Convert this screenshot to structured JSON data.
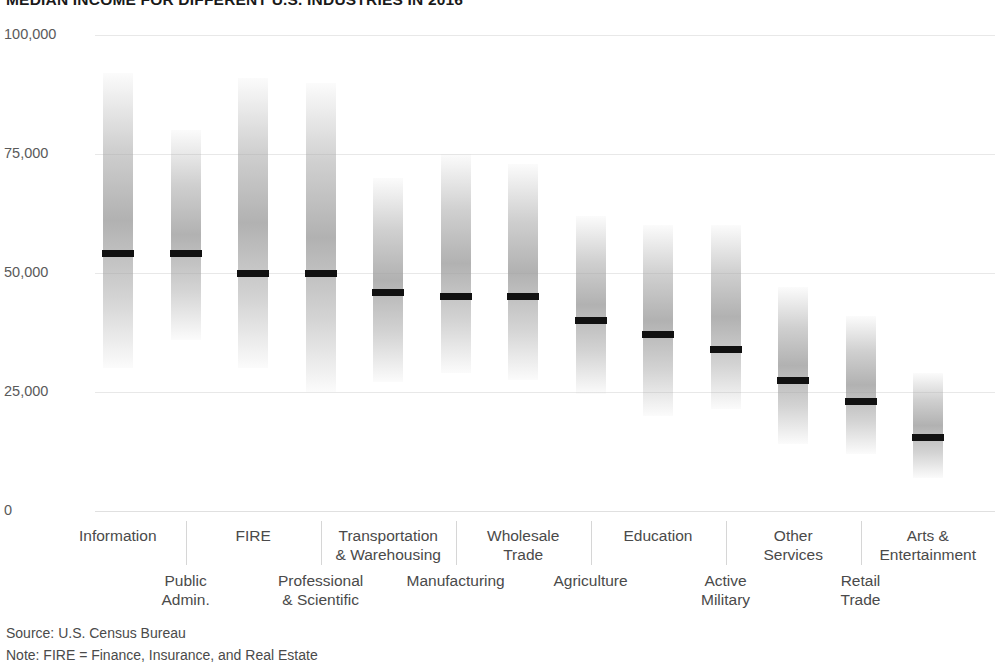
{
  "chart_data": {
    "type": "bar",
    "title": "MEDIAN INCOME FOR DIFFERENT U.S. INDUSTRIES IN 2016",
    "xlabel": "",
    "ylabel": "",
    "ylim": [
      0,
      100000
    ],
    "ytick_labels": [
      "100,000",
      "75,000",
      "50,000",
      "25,000",
      "0"
    ],
    "ytick_values": [
      100000,
      75000,
      50000,
      25000,
      0
    ],
    "grid": true,
    "legend": "none",
    "value_unit": "US dollars",
    "note": "Each bar spans the income range (low to high) with a black line marking the median.",
    "categories": [
      "Information",
      "Public Admin.",
      "FIRE",
      "Professional & Scientific",
      "Transportation & Warehousing",
      "Manufacturing",
      "Wholesale Trade",
      "Agriculture",
      "Education",
      "Active Military",
      "Other Services",
      "Retail Trade",
      "Arts & Entertainment"
    ],
    "series": [
      {
        "name": "range_high",
        "values": [
          92000,
          80000,
          91000,
          90000,
          70000,
          75000,
          73000,
          62000,
          60000,
          60000,
          47000,
          41000,
          29000
        ]
      },
      {
        "name": "median",
        "values": [
          54000,
          54000,
          50000,
          50000,
          46000,
          45000,
          45000,
          40000,
          37000,
          34000,
          27500,
          23000,
          15500
        ]
      },
      {
        "name": "range_low",
        "values": [
          30000,
          36000,
          30000,
          25000,
          27000,
          29000,
          27500,
          24500,
          20000,
          21500,
          14000,
          12000,
          7000
        ]
      }
    ]
  },
  "yaxis": {
    "ticks": [
      {
        "label": "100,000",
        "value": 100000
      },
      {
        "label": "75,000",
        "value": 75000
      },
      {
        "label": "50,000",
        "value": 50000
      },
      {
        "label": "25,000",
        "value": 25000
      },
      {
        "label": "0",
        "value": 0
      }
    ]
  },
  "xaxis": {
    "labels": [
      {
        "lines": [
          "Information"
        ],
        "row": "top"
      },
      {
        "lines": [
          "Public",
          "Admin."
        ],
        "row": "bottom"
      },
      {
        "lines": [
          "FIRE"
        ],
        "row": "top"
      },
      {
        "lines": [
          "Professional",
          "& Scientific"
        ],
        "row": "bottom"
      },
      {
        "lines": [
          "Transportation",
          "& Warehousing"
        ],
        "row": "top"
      },
      {
        "lines": [
          "Manufacturing"
        ],
        "row": "bottom"
      },
      {
        "lines": [
          "Wholesale",
          "Trade"
        ],
        "row": "top"
      },
      {
        "lines": [
          "Agriculture"
        ],
        "row": "bottom"
      },
      {
        "lines": [
          "Education"
        ],
        "row": "top"
      },
      {
        "lines": [
          "Active",
          "Military"
        ],
        "row": "bottom"
      },
      {
        "lines": [
          "Other",
          "Services"
        ],
        "row": "top"
      },
      {
        "lines": [
          "Retail",
          "Trade"
        ],
        "row": "bottom"
      },
      {
        "lines": [
          "Arts &",
          "Entertainment"
        ],
        "row": "top"
      }
    ]
  },
  "footer": {
    "source": "Source: U.S. Census Bureau",
    "note": "Note: FIRE = Finance, Insurance, and Real Estate"
  },
  "colors": {
    "bar_fill": "#9e9e9e",
    "median_line": "#111111",
    "gridline": "#e8e8e8",
    "text": "#4a4a4a",
    "title": "#1a1a1a",
    "background": "#ffffff"
  }
}
